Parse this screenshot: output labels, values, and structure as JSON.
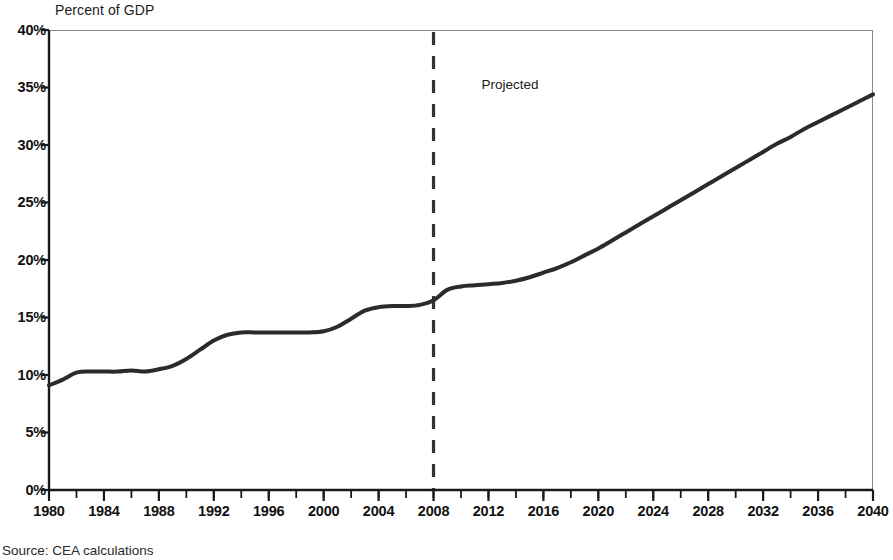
{
  "chart_data": {
    "type": "line",
    "title": "Percent of GDP",
    "xlabel": "",
    "ylabel": "Percent of GDP",
    "xlim": [
      1980,
      2040
    ],
    "ylim": [
      0,
      40
    ],
    "grid": false,
    "legend": false,
    "y_tick_labels": [
      "40%",
      "35%",
      "30%",
      "25%",
      "20%",
      "15%",
      "10%",
      "5%",
      "0%"
    ],
    "y_tick_values": [
      40,
      35,
      30,
      25,
      20,
      15,
      10,
      5,
      0
    ],
    "x_tick_labels": [
      "1980",
      "1984",
      "1988",
      "1992",
      "1996",
      "2000",
      "2004",
      "2008",
      "2012",
      "2016",
      "2020",
      "2024",
      "2028",
      "2032",
      "2036",
      "2040"
    ],
    "x_tick_values": [
      1980,
      1984,
      1988,
      1992,
      1996,
      2000,
      2004,
      2008,
      2012,
      2016,
      2020,
      2024,
      2028,
      2032,
      2036,
      2040
    ],
    "x_minor_interval": 2,
    "annotations": [
      {
        "name": "projection-divider",
        "type": "vline",
        "x": 2008,
        "style": "dashed",
        "color": "#333333"
      },
      {
        "name": "projected-text",
        "type": "text",
        "text": "Projected",
        "x": 2011.5,
        "y": 35.2
      }
    ],
    "series": [
      {
        "name": "Percent of GDP",
        "color": "#2b2b2b",
        "line_width": 4,
        "x": [
          1980,
          1981,
          1982,
          1983,
          1984,
          1985,
          1986,
          1987,
          1988,
          1989,
          1990,
          1991,
          1992,
          1993,
          1994,
          1995,
          1996,
          1997,
          1998,
          1999,
          2000,
          2001,
          2002,
          2003,
          2004,
          2005,
          2006,
          2007,
          2008,
          2009,
          2010,
          2011,
          2012,
          2013,
          2014,
          2015,
          2016,
          2017,
          2018,
          2019,
          2020,
          2021,
          2022,
          2023,
          2024,
          2025,
          2026,
          2027,
          2028,
          2029,
          2030,
          2031,
          2032,
          2033,
          2034,
          2035,
          2036,
          2037,
          2038,
          2039,
          2040
        ],
        "y": [
          9.1,
          9.6,
          10.2,
          10.3,
          10.3,
          10.3,
          10.4,
          10.3,
          10.5,
          10.8,
          11.4,
          12.2,
          13.0,
          13.5,
          13.7,
          13.7,
          13.7,
          13.7,
          13.7,
          13.7,
          13.8,
          14.2,
          14.9,
          15.6,
          15.9,
          16.0,
          16.0,
          16.1,
          16.5,
          17.4,
          17.7,
          17.8,
          17.9,
          18.0,
          18.2,
          18.5,
          18.9,
          19.3,
          19.8,
          20.4,
          21.0,
          21.7,
          22.4,
          23.1,
          23.8,
          24.5,
          25.2,
          25.9,
          26.6,
          27.3,
          28.0,
          28.7,
          29.4,
          30.1,
          30.7,
          31.4,
          32.0,
          32.6,
          33.2,
          33.8,
          34.4
        ]
      }
    ]
  },
  "source": {
    "note": "Source: CEA calculations"
  },
  "projected": {
    "label": "Projected"
  }
}
